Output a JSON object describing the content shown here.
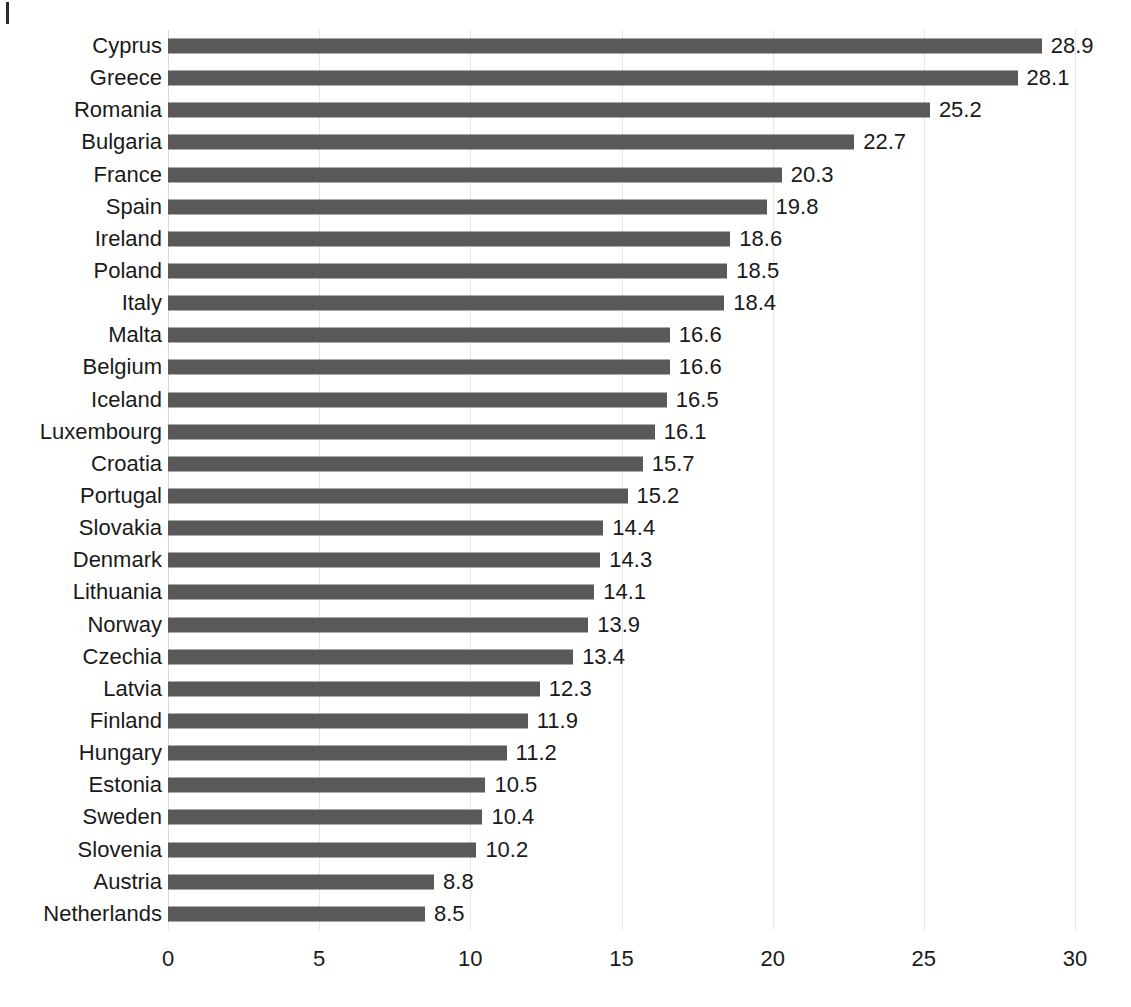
{
  "chart_data": {
    "type": "bar",
    "orientation": "horizontal",
    "title": "",
    "subtitle": "",
    "xlabel": "",
    "ylabel": "",
    "xlim": [
      0,
      30
    ],
    "xticks": [
      0,
      5,
      10,
      15,
      20,
      25,
      30
    ],
    "xtick_labels": [
      "0",
      "5",
      "10",
      "15",
      "20",
      "25",
      "30"
    ],
    "grid": true,
    "grid_axis": "x",
    "legend": false,
    "legend_position": "none",
    "value_labels": true,
    "bar_color": "#595959",
    "gridline_color": "#e6e6e6",
    "text_color": "#1a1a1a",
    "background_color": "#ffffff",
    "categories": [
      "Cyprus",
      "Greece",
      "Romania",
      "Bulgaria",
      "France",
      "Spain",
      "Ireland",
      "Poland",
      "Italy",
      "Malta",
      "Belgium",
      "Iceland",
      "Luxembourg",
      "Croatia",
      "Portugal",
      "Slovakia",
      "Denmark",
      "Lithuania",
      "Norway",
      "Czechia",
      "Latvia",
      "Finland",
      "Hungary",
      "Estonia",
      "Sweden",
      "Slovenia",
      "Austria",
      "Netherlands"
    ],
    "values": [
      28.9,
      28.1,
      25.2,
      22.7,
      20.3,
      19.8,
      18.6,
      18.5,
      18.4,
      16.6,
      16.6,
      16.5,
      16.1,
      15.7,
      15.2,
      14.4,
      14.3,
      14.1,
      13.9,
      13.4,
      12.3,
      11.9,
      11.2,
      10.5,
      10.4,
      10.2,
      8.8,
      8.5
    ],
    "value_label_texts": [
      "28.9",
      "28.1",
      "25.2",
      "22.7",
      "20.3",
      "19.8",
      "18.6",
      "18.5",
      "18.4",
      "16.6",
      "16.6",
      "16.5",
      "16.1",
      "15.7",
      "15.2",
      "14.4",
      "14.3",
      "14.1",
      "13.9",
      "13.4",
      "12.3",
      "11.9",
      "11.2",
      "10.5",
      "10.4",
      "10.2",
      "8.8",
      "8.5"
    ]
  }
}
